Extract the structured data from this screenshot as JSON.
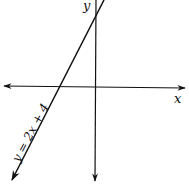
{
  "diagram": {
    "type": "coordinate-plane-line-graph",
    "axes": {
      "x_label": "x",
      "y_label": "y"
    },
    "line": {
      "equation": "y = 2x + 4",
      "slope": 2,
      "y_intercept": 4,
      "x_intercept": -2
    },
    "colors": {
      "stroke": "#111111",
      "background": "#ffffff"
    }
  }
}
